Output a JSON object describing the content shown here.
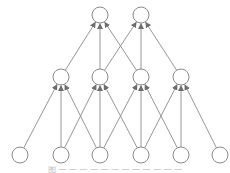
{
  "diagram": {
    "type": "neural-network-layered-graph",
    "colors": {
      "node_stroke": "#8a8a8a",
      "node_fill": "#ffffff",
      "edge": "#8a8a8a",
      "background": "#ffffff"
    },
    "node_radius": 8,
    "layers": [
      {
        "name": "input",
        "y": 155,
        "nodes_x": [
          20,
          61,
          100,
          141,
          181,
          220
        ]
      },
      {
        "name": "hidden",
        "y": 77,
        "nodes_x": [
          61,
          100,
          141,
          181
        ]
      },
      {
        "name": "output",
        "y": 15,
        "nodes_x": [
          100,
          141
        ]
      }
    ],
    "edges": [
      {
        "from": [
          0,
          0
        ],
        "to": [
          1,
          0
        ]
      },
      {
        "from": [
          0,
          1
        ],
        "to": [
          1,
          0
        ]
      },
      {
        "from": [
          0,
          2
        ],
        "to": [
          1,
          0
        ]
      },
      {
        "from": [
          0,
          1
        ],
        "to": [
          1,
          1
        ]
      },
      {
        "from": [
          0,
          2
        ],
        "to": [
          1,
          1
        ]
      },
      {
        "from": [
          0,
          3
        ],
        "to": [
          1,
          1
        ]
      },
      {
        "from": [
          0,
          2
        ],
        "to": [
          1,
          2
        ]
      },
      {
        "from": [
          0,
          3
        ],
        "to": [
          1,
          2
        ]
      },
      {
        "from": [
          0,
          4
        ],
        "to": [
          1,
          2
        ]
      },
      {
        "from": [
          0,
          3
        ],
        "to": [
          1,
          3
        ]
      },
      {
        "from": [
          0,
          4
        ],
        "to": [
          1,
          3
        ]
      },
      {
        "from": [
          0,
          5
        ],
        "to": [
          1,
          3
        ]
      },
      {
        "from": [
          1,
          0
        ],
        "to": [
          2,
          0
        ]
      },
      {
        "from": [
          1,
          1
        ],
        "to": [
          2,
          0
        ]
      },
      {
        "from": [
          1,
          2
        ],
        "to": [
          2,
          0
        ]
      },
      {
        "from": [
          1,
          1
        ],
        "to": [
          2,
          1
        ]
      },
      {
        "from": [
          1,
          2
        ],
        "to": [
          2,
          1
        ]
      },
      {
        "from": [
          1,
          3
        ],
        "to": [
          2,
          1
        ]
      }
    ]
  },
  "caption": {
    "text": "图 — — — — — — — — — — — —"
  }
}
